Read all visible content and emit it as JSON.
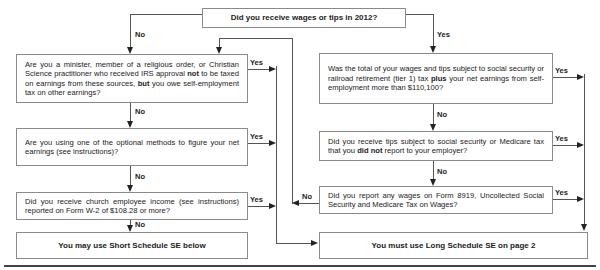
{
  "note": "Note: Use this flowchart only if you must file Schedule SE. If unsure, see Who Must File Schedule SE in the instructions.",
  "start": {
    "question": "Did you receive wages or tips in 2012?"
  },
  "left": {
    "q1": {
      "pre": "Are you a minister, member of a religious order, or Christian Science practitioner who received IRS approval ",
      "bold1": "not",
      "mid": " to be taxed on earnings from these sources, ",
      "bold2": "but",
      "post": " you owe self-employment tax on other earnings?"
    },
    "q2": {
      "text": "Are you using one of the optional methods to figure your net earnings (see instructions)?"
    },
    "q3": {
      "text": "Did you receive church employee income (see instructions) reported on Form W-2 of $108.28 or more?"
    },
    "result": "You may use Short Schedule SE below"
  },
  "right": {
    "q1": {
      "pre": "Was the total of your wages and tips subject to social security or railroad retirement (tier 1) tax ",
      "bold": "plus",
      "post": " your net earnings from self-employment more than $110,100?"
    },
    "q2": {
      "pre": "Did you receive tips subject to social security or Medicare tax that you ",
      "bold": "did not",
      "post": " report to your employer?"
    },
    "q3": {
      "text": "Did you report any wages on Form 8919, Uncollected Social Security and Medicare Tax on Wages?"
    },
    "result": "You must use Long Schedule SE on page 2"
  },
  "labels": {
    "yes": "Yes",
    "no": "No"
  }
}
